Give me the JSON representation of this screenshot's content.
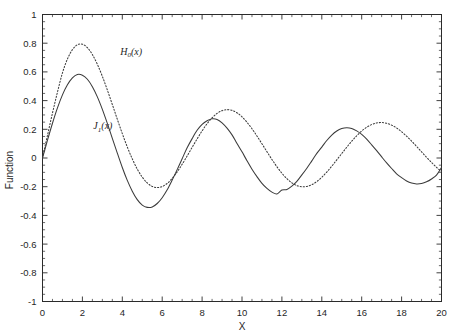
{
  "chart_data": {
    "type": "line",
    "title": "",
    "xlabel": "X",
    "ylabel": "Function",
    "xlim": [
      0,
      20
    ],
    "ylim": [
      -1,
      1
    ],
    "grid": false,
    "legend_position": "inline-annotation",
    "x_ticks": [
      0,
      2,
      4,
      6,
      8,
      10,
      12,
      14,
      16,
      18,
      20
    ],
    "x_tick_labels": [
      "0",
      "2",
      "4",
      "6",
      "8",
      "10",
      "12",
      "14",
      "16",
      "18",
      "20"
    ],
    "x_minor_tick_step": 0.5,
    "y_ticks": [
      -1,
      -0.8,
      -0.6,
      -0.4,
      -0.2,
      0,
      0.2,
      0.4,
      0.6,
      0.8,
      1
    ],
    "y_tick_labels": [
      "-1",
      "-0.8",
      "-0.6",
      "-0.4",
      "-0.2",
      "0",
      "0.2",
      "0.4",
      "0.6",
      "0.8",
      "1"
    ],
    "y_minor_tick_step": 0.05,
    "series": [
      {
        "name": "H_0(x)",
        "label_plain": "H0(x)",
        "label_base": "H",
        "label_sub": "0",
        "label_tail": "(x)",
        "style": "dotted",
        "color": "#3a3a3a",
        "annotation_x": 3.9,
        "annotation_y": 0.72,
        "x": [
          0,
          0.25,
          0.5,
          0.75,
          1,
          1.25,
          1.5,
          1.75,
          2,
          2.25,
          2.5,
          2.75,
          3,
          3.25,
          3.5,
          3.75,
          4,
          4.25,
          4.5,
          4.75,
          5,
          5.25,
          5.5,
          5.75,
          6,
          6.25,
          6.5,
          6.75,
          7,
          7.25,
          7.5,
          7.75,
          8,
          8.25,
          8.5,
          8.75,
          9,
          9.25,
          9.5,
          9.75,
          10,
          10.25,
          10.5,
          10.75,
          11,
          11.25,
          11.5,
          11.75,
          12,
          12.25,
          12.5,
          12.75,
          13,
          13.25,
          13.5,
          13.75,
          14,
          14.25,
          14.5,
          14.75,
          15,
          15.25,
          15.5,
          15.75,
          16,
          16.25,
          16.5,
          16.75,
          17,
          17.25,
          17.5,
          17.75,
          18,
          18.25,
          18.5,
          18.75,
          19,
          19.25,
          19.5,
          19.75,
          20
        ],
        "y": [
          0,
          0.158,
          0.313,
          0.459,
          0.593,
          0.69,
          0.755,
          0.789,
          0.793,
          0.769,
          0.721,
          0.653,
          0.569,
          0.474,
          0.373,
          0.27,
          0.17,
          0.077,
          -0.006,
          -0.077,
          -0.133,
          -0.174,
          -0.198,
          -0.206,
          -0.199,
          -0.177,
          -0.142,
          -0.097,
          -0.044,
          0.014,
          0.074,
          0.133,
          0.189,
          0.239,
          0.28,
          0.311,
          0.33,
          0.337,
          0.332,
          0.315,
          0.287,
          0.249,
          0.204,
          0.153,
          0.099,
          0.044,
          -0.01,
          -0.061,
          -0.106,
          -0.144,
          -0.173,
          -0.192,
          -0.2,
          -0.198,
          -0.186,
          -0.164,
          -0.134,
          -0.098,
          -0.057,
          -0.013,
          0.031,
          0.075,
          0.117,
          0.155,
          0.188,
          0.214,
          0.233,
          0.244,
          0.247,
          0.242,
          0.229,
          0.209,
          0.183,
          0.152,
          0.118,
          0.081,
          0.043,
          0.005,
          -0.031,
          -0.065,
          -0.095
        ]
      },
      {
        "name": "J_1(x)",
        "label_plain": "J1(x)",
        "label_base": "J",
        "label_sub": "1",
        "label_tail": "(x)",
        "style": "solid",
        "color": "#3a3a3a",
        "annotation_x": 2.55,
        "annotation_y": 0.2,
        "x": [
          0,
          0.25,
          0.5,
          0.75,
          1,
          1.25,
          1.5,
          1.75,
          2,
          2.25,
          2.5,
          2.75,
          3,
          3.25,
          3.5,
          3.75,
          4,
          4.25,
          4.5,
          4.75,
          5,
          5.25,
          5.5,
          5.75,
          6,
          6.25,
          6.5,
          6.75,
          7,
          7.25,
          7.5,
          7.75,
          8,
          8.25,
          8.5,
          8.75,
          9,
          9.25,
          9.5,
          9.75,
          10,
          10.25,
          10.5,
          10.75,
          11,
          11.25,
          11.5,
          11.75,
          12,
          12.25,
          12.5,
          12.75,
          13,
          13.25,
          13.5,
          13.75,
          14,
          14.25,
          14.5,
          14.75,
          15,
          15.25,
          15.5,
          15.75,
          16,
          16.25,
          16.5,
          16.75,
          17,
          17.25,
          17.5,
          17.75,
          18,
          18.25,
          18.5,
          18.75,
          19,
          19.25,
          19.5,
          19.75,
          20
        ],
        "y": [
          0,
          0.124,
          0.242,
          0.349,
          0.44,
          0.51,
          0.558,
          0.582,
          0.577,
          0.549,
          0.497,
          0.426,
          0.339,
          0.241,
          0.137,
          0.034,
          -0.066,
          -0.156,
          -0.231,
          -0.29,
          -0.328,
          -0.344,
          -0.341,
          -0.317,
          -0.277,
          -0.222,
          -0.154,
          -0.081,
          -0.005,
          0.071,
          0.135,
          0.193,
          0.235,
          0.26,
          0.273,
          0.269,
          0.245,
          0.208,
          0.161,
          0.101,
          0.043,
          -0.019,
          -0.078,
          -0.13,
          -0.177,
          -0.212,
          -0.238,
          -0.251,
          -0.223,
          -0.219,
          -0.196,
          -0.163,
          -0.118,
          -0.071,
          -0.02,
          0.032,
          0.076,
          0.122,
          0.16,
          0.188,
          0.205,
          0.211,
          0.206,
          0.189,
          0.164,
          0.131,
          0.092,
          0.051,
          0.008,
          -0.034,
          -0.073,
          -0.11,
          -0.137,
          -0.16,
          -0.175,
          -0.181,
          -0.178,
          -0.166,
          -0.146,
          -0.119,
          -0.066
        ]
      }
    ]
  },
  "axes": {
    "x_axis_title": "X",
    "y_axis_title": "Function"
  }
}
